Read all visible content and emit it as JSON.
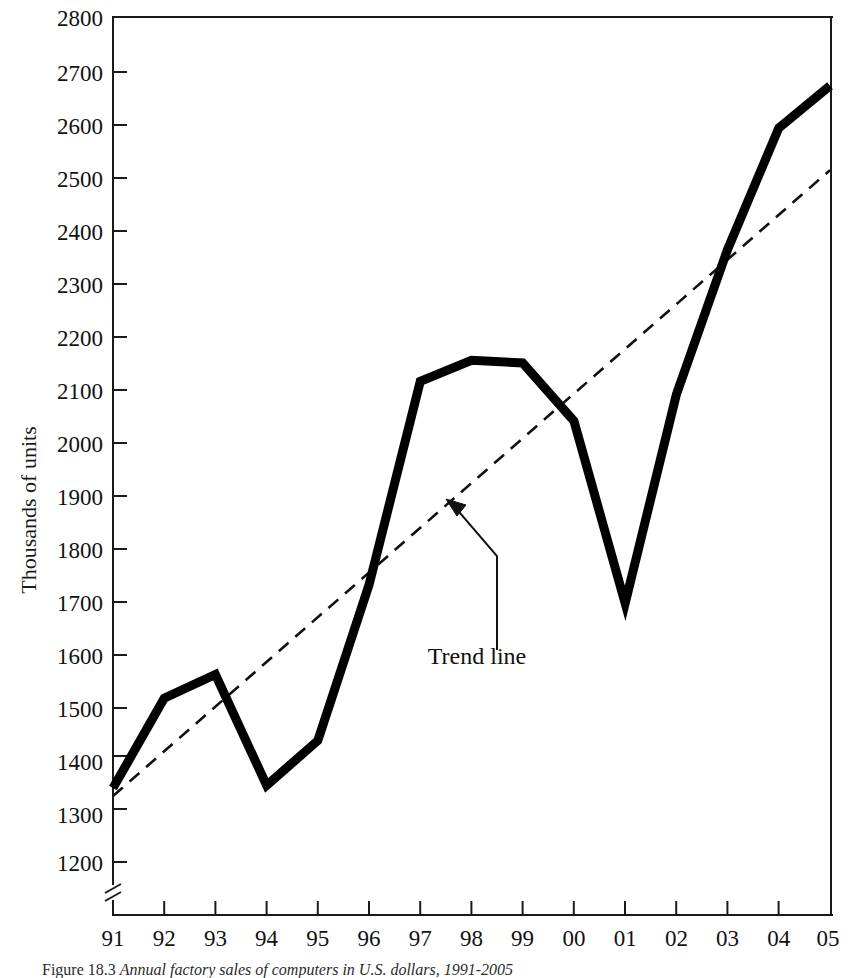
{
  "figure": {
    "caption_prefix": "Figure 18.3",
    "caption_text": "Annual factory sales of computers in U.S. dollars, 1991-2005",
    "caption_italic_part": "U.S. dollars, 1991-2005"
  },
  "chart_data": {
    "type": "line",
    "title": "",
    "xlabel": "",
    "ylabel": "Thousands of units",
    "categories": [
      "91",
      "92",
      "93",
      "94",
      "95",
      "96",
      "97",
      "98",
      "99",
      "00",
      "01",
      "02",
      "03",
      "04",
      "05"
    ],
    "x_tick_labels": [
      "91",
      "92",
      "93",
      "94",
      "95",
      "96",
      "97",
      "98",
      "99",
      "00",
      "01",
      "02",
      "03",
      "04",
      "05"
    ],
    "y_tick_labels": [
      "1200",
      "1300",
      "1400",
      "1500",
      "1600",
      "1700",
      "1800",
      "1900",
      "2000",
      "2100",
      "2200",
      "2300",
      "2400",
      "2500",
      "2600",
      "2700",
      "2800"
    ],
    "y_tick_values": [
      1200,
      1300,
      1400,
      1500,
      1600,
      1700,
      1800,
      1900,
      2000,
      2100,
      2200,
      2300,
      2400,
      2500,
      2600,
      2700,
      2800
    ],
    "ylim": [
      1200,
      2800
    ],
    "axis_break": true,
    "axis_break_note": "zigzag break between 0 and 1200 on the y axis",
    "grid": false,
    "legend": "none",
    "series": [
      {
        "name": "Annual factory sales",
        "style": "solid-thick",
        "color": "#000000",
        "values": [
          1340,
          1510,
          1555,
          1345,
          1430,
          1725,
          2110,
          2150,
          2145,
          2035,
          1690,
          2085,
          2360,
          2590,
          2670
        ]
      },
      {
        "name": "Trend line",
        "style": "dashed",
        "color": "#111111",
        "endpoints": {
          "x_start": "91",
          "y_start": 1325,
          "x_end": "05",
          "y_end": 2510
        }
      }
    ],
    "annotations": [
      {
        "label": "Trend line",
        "points_to_x": "97.4",
        "points_to_y": 1880,
        "label_x": "98.4",
        "label_y": 1630
      }
    ]
  },
  "colors": {
    "background": "#ffffff",
    "axis": "#1a1a1a",
    "data_series": "#000000",
    "trend": "#111111",
    "text": "#111111"
  }
}
